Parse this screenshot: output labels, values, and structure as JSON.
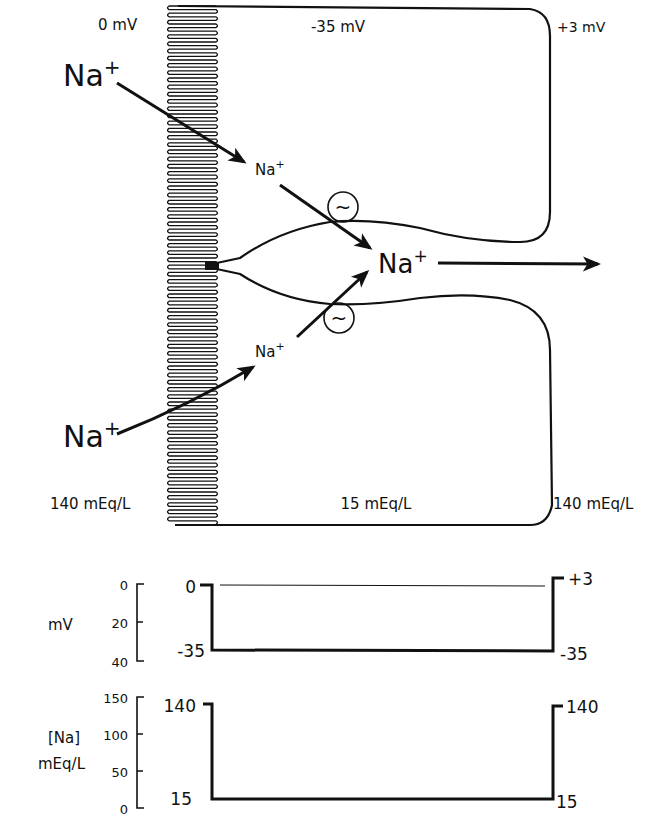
{
  "diagram": {
    "cell_labels": {
      "apical_potential": "0 mV",
      "cell_potential": "-35 mV",
      "basolateral_potential": "+3 mV",
      "lumen_concentration": "140 mEq/L",
      "cell_concentration": "15 mEq/L",
      "interstitial_concentration": "140 mEq/L"
    },
    "ions": {
      "lumen_top": {
        "base": "Na",
        "charge": "+"
      },
      "lumen_bottom": {
        "base": "Na",
        "charge": "+"
      },
      "cell_top": {
        "base": "Na",
        "charge": "+"
      },
      "cell_bottom": {
        "base": "Na",
        "charge": "+"
      },
      "intercellular": {
        "base": "Na",
        "charge": "+"
      }
    },
    "pump_symbol": "~",
    "pump_icon": "sodium-pump-icon",
    "brush_border_icon": "microvilli-icon",
    "colors": {
      "ink": "#111111",
      "background": "#ffffff"
    }
  },
  "chart_data": [
    {
      "type": "line",
      "title": "Membrane potential profile",
      "ylabel": "mV",
      "yticks": [
        "0",
        "20",
        "40"
      ],
      "ylim": [
        0,
        40
      ],
      "y_inverted": true,
      "x": [
        "lumen",
        "cell",
        "interstitium"
      ],
      "values": [
        0,
        -35,
        3
      ],
      "annotations": {
        "left_top": "0",
        "left_bottom": "-35",
        "right_top": "+3",
        "right_bottom": "-35"
      },
      "grid": false
    },
    {
      "type": "line",
      "title": "Sodium concentration profile",
      "ylabel_line1": "[Na]",
      "ylabel_line2": "mEq/L",
      "yticks": [
        "150",
        "100",
        "50",
        "0"
      ],
      "ylim": [
        0,
        150
      ],
      "x": [
        "lumen",
        "cell",
        "interstitium"
      ],
      "values": [
        140,
        15,
        140
      ],
      "annotations": {
        "left_top": "140",
        "left_bottom": "15",
        "right_top": "140",
        "right_bottom": "15"
      },
      "grid": false
    }
  ]
}
